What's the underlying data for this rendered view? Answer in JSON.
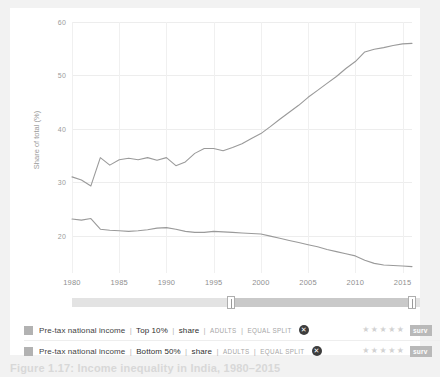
{
  "chart_data": {
    "type": "line",
    "title": "",
    "xlabel": "",
    "ylabel": "Share of total (%)",
    "xlim": [
      1980,
      2016
    ],
    "ylim": [
      13,
      60
    ],
    "grid": true,
    "legend_position": "bottom",
    "yticks": [
      60,
      50,
      40,
      30,
      20
    ],
    "xticks": [
      1980,
      1985,
      1990,
      1995,
      2000,
      2005,
      2010,
      2015
    ],
    "x": [
      1980,
      1981,
      1982,
      1983,
      1984,
      1985,
      1986,
      1987,
      1988,
      1989,
      1990,
      1991,
      1992,
      1993,
      1994,
      1995,
      1996,
      1997,
      1998,
      1999,
      2000,
      2001,
      2002,
      2003,
      2004,
      2005,
      2006,
      2007,
      2008,
      2009,
      2010,
      2011,
      2012,
      2013,
      2014,
      2015,
      2016
    ],
    "series": [
      {
        "name": "Pre-tax national income | Top 10% | share",
        "color": "#9a9a9a",
        "values": [
          31.0,
          30.4,
          29.3,
          34.6,
          33.2,
          34.2,
          34.5,
          34.2,
          34.6,
          34.1,
          34.6,
          33.1,
          33.8,
          35.4,
          36.3,
          36.3,
          35.9,
          36.5,
          37.2,
          38.2,
          39.1,
          40.4,
          41.8,
          43.1,
          44.4,
          45.9,
          47.2,
          48.5,
          49.8,
          51.3,
          52.6,
          54.4,
          54.9,
          55.2,
          55.6,
          55.9,
          56.0
        ]
      },
      {
        "name": "Pre-tax national income | Bottom 50% | share",
        "color": "#9a9a9a",
        "values": [
          23.1,
          22.9,
          23.2,
          21.2,
          21.0,
          20.9,
          20.8,
          20.9,
          21.1,
          21.4,
          21.5,
          21.2,
          20.8,
          20.6,
          20.6,
          20.8,
          20.7,
          20.6,
          20.5,
          20.4,
          20.3,
          19.9,
          19.5,
          19.1,
          18.7,
          18.3,
          17.9,
          17.4,
          17.0,
          16.6,
          16.2,
          15.4,
          14.8,
          14.5,
          14.4,
          14.3,
          14.2
        ]
      }
    ]
  },
  "axis": {
    "ylabel": "Share of total (%)",
    "yticks": [
      "60",
      "50",
      "40",
      "30",
      "20"
    ],
    "xticks": [
      "1980",
      "1985",
      "1990",
      "1995",
      "2000",
      "2005",
      "2010",
      "2015"
    ]
  },
  "range_slider": {
    "left_handle_label": "",
    "right_handle_label": ""
  },
  "legend": {
    "rows": [
      {
        "indicator": "Pre-tax national income",
        "group": "Top 10%",
        "metric": "share",
        "population": "ADULTS",
        "split": "EQUAL SPLIT",
        "close_label": "✕",
        "rating": "★★★★★",
        "action_label": "surv",
        "swatch_color": "#b2b2b2"
      },
      {
        "indicator": "Pre-tax national income",
        "group": "Bottom 50%",
        "metric": "share",
        "population": "ADULTS",
        "split": "EQUAL SPLIT",
        "close_label": "✕",
        "rating": "★★★★★",
        "action_label": "surv",
        "swatch_color": "#b2b2b2"
      }
    ],
    "separator": "|"
  },
  "caption": "Figure 1.17: Income inequality in India, 1980–2015"
}
